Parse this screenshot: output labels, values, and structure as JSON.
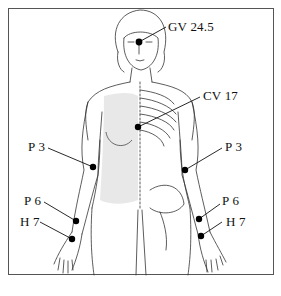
{
  "diagram": {
    "colors": {
      "line": "#222222",
      "point": "#000000",
      "frame": "#555555",
      "shading": "#d9d9d9"
    },
    "points": [
      {
        "id": "gv-24-5",
        "label": "GV 24.5",
        "x": 139,
        "y": 42,
        "label_x": 168,
        "label_y": 20
      },
      {
        "id": "cv-17",
        "label": "CV 17",
        "x": 138,
        "y": 127,
        "label_x": 203,
        "label_y": 89
      },
      {
        "id": "p3-left",
        "label": "P 3",
        "x": 93,
        "y": 167,
        "label_x": 28,
        "label_y": 140
      },
      {
        "id": "p3-right",
        "label": "P 3",
        "x": 185,
        "y": 170,
        "label_x": 225,
        "label_y": 140
      },
      {
        "id": "p6-left",
        "label": "P 6",
        "x": 76,
        "y": 221,
        "label_x": 24,
        "label_y": 194
      },
      {
        "id": "h7-left",
        "label": "H 7",
        "x": 72,
        "y": 239,
        "label_x": 20,
        "label_y": 215
      },
      {
        "id": "p6-right",
        "label": "P 6",
        "x": 199,
        "y": 219,
        "label_x": 222,
        "label_y": 194
      },
      {
        "id": "h7-right",
        "label": "H 7",
        "x": 201,
        "y": 236,
        "label_x": 226,
        "label_y": 215
      }
    ]
  }
}
